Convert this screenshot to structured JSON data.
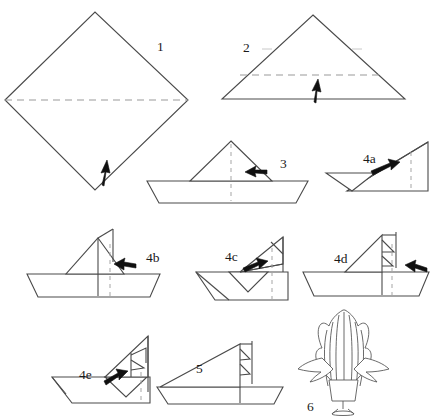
{
  "figure": {
    "kind": "line-art instruction sheet",
    "background_color": "#ffffff",
    "line_color": "#4a4a4a",
    "dashed_line_color": "#9a9a9a",
    "arrow_color": "#101010"
  },
  "steps": [
    {
      "id": "step-1",
      "label": "1",
      "label_x": 157,
      "label_y": 51,
      "shape": "square-diamond",
      "description": "Square rotated 45 degrees with horizontal valley fold line across the middle",
      "fold_line": "horizontal-dashed",
      "arrow": "up"
    },
    {
      "id": "step-2",
      "label": "2",
      "label_x": 243,
      "label_y": 52,
      "shape": "triangle",
      "description": "Triangle with horizontal dashed fold near the base",
      "fold_line": "horizontal-dashed",
      "arrow": "up"
    },
    {
      "id": "step-3",
      "label": "3",
      "label_x": 280,
      "label_y": 168,
      "shape": "boat-plain-sail",
      "description": "Boat hull with single triangular sail and vertical dashed center line",
      "fold_line": "vertical-dashed",
      "arrow": "left"
    },
    {
      "id": "step-4a",
      "label": "4a",
      "label_x": 363,
      "label_y": 163,
      "shape": "right-triangle-partial",
      "description": "Right triangle form with vertical dashed line near right edge",
      "fold_line": "vertical-dashed",
      "arrow": "right"
    },
    {
      "id": "step-4b",
      "label": "4b",
      "label_x": 146,
      "label_y": 262,
      "shape": "boat-sail-vertical",
      "description": "Boat with sail, solid vertical mast line and dashed fold line",
      "fold_line": "vertical-dashed",
      "arrow": "left"
    },
    {
      "id": "step-4c",
      "label": "4c",
      "label_x": 225,
      "label_y": 261,
      "shape": "boat-folded-right",
      "description": "Boat leaning with folded right section and dashed vertical line",
      "fold_line": "vertical-dashed",
      "arrow": "right"
    },
    {
      "id": "step-4d",
      "label": "4d",
      "label_x": 334,
      "label_y": 263,
      "shape": "boat-nested-sail",
      "description": "Boat with sail subdivided into nested triangles",
      "fold_line": "vertical-dashed",
      "arrow": "left"
    },
    {
      "id": "step-4e",
      "label": "4e",
      "label_x": 79,
      "label_y": 379,
      "shape": "boat-pleated-sail",
      "description": "Boat with pleated triangular sail panels",
      "fold_line": "vertical-dashed",
      "arrow": "right"
    },
    {
      "id": "step-5",
      "label": "5",
      "label_x": 196,
      "label_y": 373,
      "shape": "boat-finished-sail",
      "description": "Completed boat with layered triangular sail",
      "fold_line": "none",
      "arrow": "none"
    },
    {
      "id": "step-6",
      "label": "6",
      "label_x": 307,
      "label_y": 411,
      "shape": "finished-model",
      "description": "Finished three dimensional model: fanned plume on a pedestal base with side wings",
      "fold_line": "none",
      "arrow": "none"
    }
  ]
}
